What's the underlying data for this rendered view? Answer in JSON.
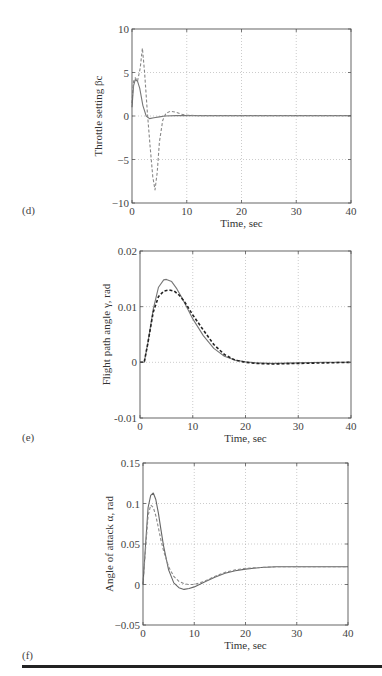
{
  "page": {
    "panel_labels": [
      "(d)",
      "(e)",
      "(f)"
    ],
    "rule_color": "#222222"
  },
  "chart_data": [
    {
      "type": "line",
      "panel": "(d)",
      "title": "",
      "xlabel": "Time, sec",
      "ylabel": "Throttle setting βc",
      "xlim": [
        0,
        40
      ],
      "ylim": [
        -10,
        10
      ],
      "xticks": [
        0,
        10,
        20,
        30,
        40
      ],
      "yticks": [
        -10,
        -5,
        0,
        5,
        10
      ],
      "ytick_labels": [
        "−10",
        "−5",
        "0",
        "5",
        "10"
      ],
      "grid": true,
      "legend": null,
      "series": [
        {
          "name": "solid",
          "style": "solid",
          "color": "#777777",
          "x": [
            0,
            0.3,
            0.6,
            1.0,
            1.4,
            2.0,
            2.6,
            3.2,
            4.0,
            5.0,
            6.0,
            8.0,
            10.0,
            15.0,
            20.0,
            30.0,
            40.0
          ],
          "y": [
            1.0,
            3.5,
            4.2,
            4.0,
            3.2,
            1.2,
            0.0,
            -0.3,
            -0.2,
            -0.1,
            0.0,
            0.05,
            0.05,
            0.05,
            0.05,
            0.05,
            0.05
          ]
        },
        {
          "name": "dashed",
          "style": "dashed",
          "color": "#888888",
          "x": [
            0,
            0.3,
            0.6,
            1.0,
            1.5,
            1.9,
            2.3,
            2.8,
            3.3,
            3.8,
            4.2,
            4.6,
            5.0,
            5.6,
            6.2,
            7.0,
            8.0,
            9.0,
            10.0,
            12.0,
            20.0,
            40.0
          ],
          "y": [
            1.5,
            4.0,
            4.4,
            4.0,
            5.5,
            7.8,
            5.0,
            0.5,
            -3.5,
            -7.0,
            -8.5,
            -6.5,
            -3.0,
            -0.5,
            0.3,
            0.55,
            0.45,
            0.2,
            0.1,
            0.05,
            0.05,
            0.05
          ]
        }
      ]
    },
    {
      "type": "line",
      "panel": "(e)",
      "title": "",
      "xlabel": "Time, sec",
      "ylabel": "Flight path angle γ, rad",
      "xlim": [
        0,
        40
      ],
      "ylim": [
        -0.01,
        0.02
      ],
      "xticks": [
        0,
        10,
        20,
        30,
        40
      ],
      "yticks": [
        -0.01,
        0,
        0.01,
        0.02
      ],
      "ytick_labels": [
        "-0.01",
        "0",
        "0.01",
        "0.02"
      ],
      "grid": true,
      "legend": null,
      "series": [
        {
          "name": "solid",
          "style": "solid",
          "color": "#777777",
          "x": [
            0,
            0.8,
            1.5,
            2.5,
            3.5,
            4.5,
            5.0,
            6.0,
            7.0,
            8.0,
            10.0,
            12.0,
            14.0,
            16.0,
            18.0,
            20.0,
            22.0,
            25.0,
            30.0,
            35.0,
            40.0
          ],
          "y": [
            0,
            0,
            0.0035,
            0.0095,
            0.0135,
            0.0148,
            0.0149,
            0.0145,
            0.0132,
            0.0115,
            0.0078,
            0.0048,
            0.0025,
            0.0011,
            0.0004,
            0.0001,
            -0.0001,
            -0.0002,
            -0.0001,
            0.0,
            0.0
          ]
        },
        {
          "name": "dashed",
          "style": "dashed",
          "color": "#222222",
          "x": [
            0,
            0.8,
            1.5,
            2.5,
            3.5,
            4.5,
            5.5,
            6.5,
            7.5,
            8.5,
            10.0,
            12.0,
            14.0,
            16.0,
            18.0,
            20.0,
            22.0,
            25.0,
            30.0,
            35.0,
            40.0
          ],
          "y": [
            0,
            0,
            0.0035,
            0.009,
            0.0118,
            0.0128,
            0.013,
            0.0128,
            0.012,
            0.0108,
            0.0085,
            0.0058,
            0.0032,
            0.0014,
            0.0004,
            0.0,
            -0.0002,
            -0.0003,
            -0.0002,
            -0.0001,
            0.0
          ]
        }
      ]
    },
    {
      "type": "line",
      "panel": "(f)",
      "title": "",
      "xlabel": "Time, sec",
      "ylabel": "Angle of attack α, rad",
      "xlim": [
        0,
        40
      ],
      "ylim": [
        -0.05,
        0.15
      ],
      "xticks": [
        0,
        10,
        20,
        30,
        40
      ],
      "yticks": [
        -0.05,
        0,
        0.05,
        0.1,
        0.15
      ],
      "ytick_labels": [
        "−0.05",
        "0",
        "0.05",
        "0.1",
        "0.15"
      ],
      "grid": true,
      "legend": null,
      "series": [
        {
          "name": "solid",
          "style": "solid",
          "color": "#666666",
          "x": [
            0,
            0.5,
            1.0,
            1.5,
            2.0,
            2.5,
            3.0,
            3.5,
            4.0,
            5.0,
            6.0,
            7.0,
            8.0,
            9.0,
            10.0,
            12.0,
            14.0,
            16.0,
            18.0,
            20.0,
            23.0,
            26.0,
            30.0,
            35.0,
            40.0
          ],
          "y": [
            0.0,
            0.05,
            0.095,
            0.11,
            0.113,
            0.105,
            0.088,
            0.068,
            0.048,
            0.018,
            0.002,
            -0.004,
            -0.006,
            -0.005,
            -0.003,
            0.003,
            0.009,
            0.014,
            0.017,
            0.019,
            0.021,
            0.022,
            0.022,
            0.022,
            0.022
          ]
        },
        {
          "name": "dashed",
          "style": "dashed",
          "color": "#888888",
          "x": [
            0,
            0.5,
            1.0,
            1.5,
            2.0,
            2.5,
            3.0,
            3.5,
            4.0,
            5.0,
            6.0,
            7.0,
            8.0,
            9.0,
            10.0,
            12.0,
            14.0,
            16.0,
            18.0,
            20.0,
            23.0,
            26.0,
            30.0,
            35.0,
            40.0
          ],
          "y": [
            0.0,
            0.045,
            0.085,
            0.098,
            0.095,
            0.085,
            0.07,
            0.055,
            0.042,
            0.022,
            0.01,
            0.004,
            0.001,
            0.0,
            0.0,
            0.004,
            0.01,
            0.015,
            0.018,
            0.02,
            0.021,
            0.022,
            0.022,
            0.022,
            0.022
          ]
        }
      ]
    }
  ]
}
